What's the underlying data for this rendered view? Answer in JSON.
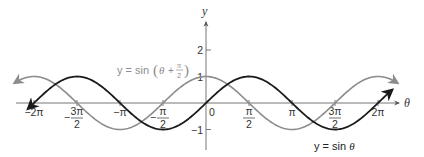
{
  "chart_data": {
    "type": "line",
    "title": "",
    "xlabel": "θ",
    "ylabel": "y",
    "xlim": [
      -6.9,
      6.9
    ],
    "ylim": [
      -1.5,
      2.7
    ],
    "grid": false,
    "x_ticks": [
      {
        "value": -6.2832,
        "label": "−2π",
        "num": "",
        "den": ""
      },
      {
        "value": -4.7124,
        "label": "−3π/2",
        "num": "3π",
        "den": "2",
        "sign": "−"
      },
      {
        "value": -3.1416,
        "label": "−π",
        "num": "",
        "den": ""
      },
      {
        "value": -1.5708,
        "label": "−π/2",
        "num": "π",
        "den": "2",
        "sign": "−"
      },
      {
        "value": 0,
        "label": "0",
        "num": "",
        "den": ""
      },
      {
        "value": 1.5708,
        "label": "π/2",
        "num": "π",
        "den": "2",
        "sign": ""
      },
      {
        "value": 3.1416,
        "label": "π",
        "num": "",
        "den": ""
      },
      {
        "value": 4.7124,
        "label": "3π/2",
        "num": "3π",
        "den": "2",
        "sign": ""
      },
      {
        "value": 6.2832,
        "label": "2π",
        "num": "",
        "den": ""
      }
    ],
    "y_ticks": [
      {
        "value": 2,
        "label": "2"
      },
      {
        "value": 1,
        "label": "1"
      },
      {
        "value": -1,
        "label": "−1"
      }
    ],
    "series": [
      {
        "name": "y = sin θ",
        "color": "#1a1a1a",
        "function": "sin(θ)",
        "domain": [
          -6.5,
          6.8
        ],
        "x": [
          -6.2832,
          -4.7124,
          -3.1416,
          -1.5708,
          0,
          1.5708,
          3.1416,
          4.7124,
          6.2832
        ],
        "values": [
          0,
          1,
          0,
          -1,
          0,
          1,
          0,
          -1,
          0
        ]
      },
      {
        "name": "y = sin(θ + π/2)",
        "color": "#8c8c8c",
        "function": "sin(θ + π/2)",
        "domain": [
          -7.0,
          7.0
        ],
        "x": [
          -6.2832,
          -4.7124,
          -3.1416,
          -1.5708,
          0,
          1.5708,
          3.1416,
          4.7124,
          6.2832
        ],
        "values": [
          1,
          0,
          -1,
          0,
          1,
          0,
          -1,
          0,
          1
        ]
      }
    ],
    "annotations": [
      {
        "text": "y = sin(θ + π/2)",
        "series": 1
      },
      {
        "text": "y = sin θ",
        "series": 0
      }
    ]
  },
  "labels": {
    "y_axis": "y",
    "x_axis": "θ",
    "origin": "0",
    "shifted_eq_prefix": "y = sin",
    "shifted_eq_theta": "θ",
    "shifted_eq_plus": "+",
    "shifted_eq_num": "π",
    "shifted_eq_den": "2",
    "sin_eq_prefix": "y = sin",
    "sin_eq_theta": "θ"
  }
}
